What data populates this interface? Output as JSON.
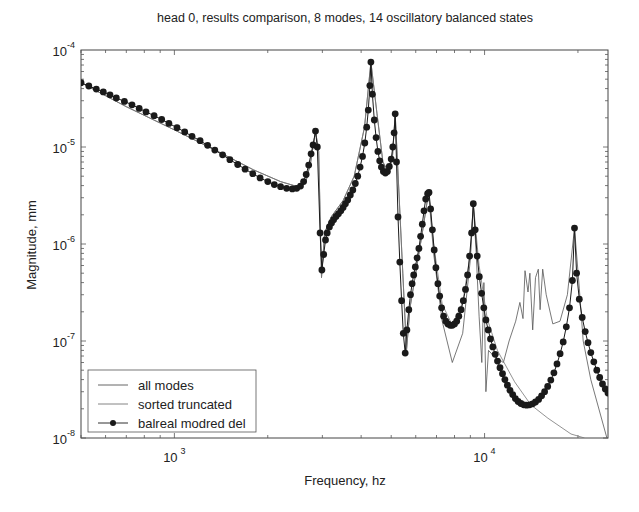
{
  "chart_data": {
    "type": "line",
    "title": "head 0, results comparison, 8 modes, 14 oscillatory balanced states",
    "xlabel": "Frequency, hz",
    "ylabel": "Magnitude, mm",
    "xscale": "log",
    "yscale": "log",
    "xlim": [
      500,
      25000
    ],
    "ylim": [
      1e-08,
      0.0001
    ],
    "xticks": [
      {
        "base": "10",
        "exp": "3",
        "value": 1000
      },
      {
        "base": "10",
        "exp": "4",
        "value": 10000
      }
    ],
    "yticks": [
      {
        "base": "10",
        "exp": "-4",
        "value": 0.0001
      },
      {
        "base": "10",
        "exp": "-5",
        "value": 1e-05
      },
      {
        "base": "10",
        "exp": "-6",
        "value": 1e-06
      },
      {
        "base": "10",
        "exp": "-7",
        "value": 1e-07
      },
      {
        "base": "10",
        "exp": "-8",
        "value": 1e-08
      }
    ],
    "grid": false,
    "legend_position": "bottom-left",
    "series": [
      {
        "name": "all modes",
        "style": "thin-line",
        "color": "#555555",
        "points": [
          [
            500,
            4.6e-05
          ],
          [
            700,
            2.6e-05
          ],
          [
            1000,
            1.5e-05
          ],
          [
            1400,
            8.8e-06
          ],
          [
            1800,
            5.8e-06
          ],
          [
            2200,
            4.4e-06
          ],
          [
            2500,
            3.9e-06
          ],
          [
            2650,
            4.3e-06
          ],
          [
            2750,
            7e-06
          ],
          [
            2850,
            1.46e-05
          ],
          [
            2920,
            9e-06
          ],
          [
            2980,
            4.5e-07
          ],
          [
            3050,
            1.3e-06
          ],
          [
            3200,
            1.9e-06
          ],
          [
            3500,
            2.8e-06
          ],
          [
            3800,
            5e-06
          ],
          [
            4100,
            1.6e-05
          ],
          [
            4300,
            7.5e-05
          ],
          [
            4500,
            2.2e-05
          ],
          [
            4700,
            7e-06
          ],
          [
            4900,
            5.5e-06
          ],
          [
            5050,
            8e-06
          ],
          [
            5150,
            2.2e-05
          ],
          [
            5250,
            6e-06
          ],
          [
            5450,
            5e-07
          ],
          [
            5600,
            8e-08
          ],
          [
            5750,
            2.2e-07
          ],
          [
            6000,
            5e-07
          ],
          [
            6300,
            1.3e-06
          ],
          [
            6600,
            3.4e-06
          ],
          [
            6850,
            8e-07
          ],
          [
            7300,
            1.6e-07
          ],
          [
            7870,
            6e-08
          ],
          [
            8500,
            1.2e-07
          ],
          [
            9000,
            7e-07
          ],
          [
            9200,
            2.6e-06
          ],
          [
            9400,
            8e-07
          ],
          [
            9600,
            1.8e-07
          ],
          [
            9800,
            6e-08
          ],
          [
            9950,
            4e-07
          ],
          [
            10100,
            3e-08
          ],
          [
            10300,
            8e-08
          ],
          [
            10700,
            7e-08
          ],
          [
            11500,
            6e-08
          ],
          [
            12000,
            1e-07
          ],
          [
            12600,
            1.6e-07
          ],
          [
            13000,
            2.5e-07
          ],
          [
            13300,
            1.7e-07
          ],
          [
            13500,
            5.3e-07
          ],
          [
            13800,
            3.2e-07
          ],
          [
            14000,
            5e-07
          ],
          [
            14300,
            1.3e-07
          ],
          [
            14600,
            4.5e-07
          ],
          [
            14900,
            5.5e-07
          ],
          [
            15100,
            2.1e-07
          ],
          [
            15400,
            5.5e-07
          ],
          [
            15800,
            3e-07
          ],
          [
            16600,
            1.5e-07
          ],
          [
            17500,
            1.6e-07
          ],
          [
            18500,
            3e-07
          ],
          [
            19500,
            1.46e-06
          ],
          [
            20200,
            3.5e-07
          ],
          [
            20800,
            1e-07
          ],
          [
            22000,
            4e-08
          ],
          [
            24800,
            1e-08
          ]
        ]
      },
      {
        "name": "sorted truncated",
        "style": "thin-line",
        "color": "#777777",
        "points": [
          [
            500,
            4.6e-05
          ],
          [
            700,
            2.6e-05
          ],
          [
            1000,
            1.5e-05
          ],
          [
            1400,
            8.8e-06
          ],
          [
            1800,
            5.8e-06
          ],
          [
            2200,
            4.4e-06
          ],
          [
            2500,
            3.9e-06
          ],
          [
            2650,
            4.3e-06
          ],
          [
            2750,
            7e-06
          ],
          [
            2850,
            1.46e-05
          ],
          [
            2920,
            9e-06
          ],
          [
            2980,
            4.5e-07
          ],
          [
            3050,
            1.3e-06
          ],
          [
            3200,
            1.9e-06
          ],
          [
            3500,
            2.8e-06
          ],
          [
            3800,
            5e-06
          ],
          [
            4100,
            1.6e-05
          ],
          [
            4300,
            7.5e-05
          ],
          [
            4500,
            2.2e-05
          ],
          [
            4700,
            7e-06
          ],
          [
            4900,
            5.5e-06
          ],
          [
            5050,
            8e-06
          ],
          [
            5150,
            2.2e-05
          ],
          [
            5250,
            6e-06
          ],
          [
            5450,
            5e-07
          ],
          [
            5600,
            8e-08
          ],
          [
            5750,
            2.2e-07
          ],
          [
            6000,
            5e-07
          ],
          [
            6300,
            1.3e-06
          ],
          [
            6600,
            3.4e-06
          ],
          [
            6850,
            1e-06
          ],
          [
            7300,
            2.4e-07
          ],
          [
            7870,
            1.45e-07
          ],
          [
            8500,
            2.5e-07
          ],
          [
            9000,
            8e-07
          ],
          [
            9200,
            2.6e-06
          ],
          [
            9600,
            6e-07
          ],
          [
            10200,
            1.7e-07
          ],
          [
            11000,
            8e-08
          ],
          [
            12500,
            3.8e-08
          ],
          [
            14100,
            2.2e-08
          ],
          [
            16000,
            1.6e-08
          ],
          [
            19000,
            1.1e-08
          ],
          [
            21000,
            1e-08
          ]
        ]
      },
      {
        "name": "balreal modred del",
        "style": "line-with-dots",
        "color": "#1a1a1a",
        "points": [
          [
            500,
            4.6e-05
          ],
          [
            530,
            4.25e-05
          ],
          [
            560,
            3.95e-05
          ],
          [
            590,
            3.7e-05
          ],
          [
            620,
            3.45e-05
          ],
          [
            650,
            3.2e-05
          ],
          [
            690,
            2.95e-05
          ],
          [
            730,
            2.72e-05
          ],
          [
            770,
            2.5e-05
          ],
          [
            810,
            2.3e-05
          ],
          [
            860,
            2.1e-05
          ],
          [
            910,
            1.92e-05
          ],
          [
            960,
            1.75e-05
          ],
          [
            1020,
            1.58e-05
          ],
          [
            1080,
            1.43e-05
          ],
          [
            1140,
            1.29e-05
          ],
          [
            1210,
            1.16e-05
          ],
          [
            1280,
            1.04e-05
          ],
          [
            1350,
            9.3e-06
          ],
          [
            1430,
            8.3e-06
          ],
          [
            1510,
            7.4e-06
          ],
          [
            1600,
            6.6e-06
          ],
          [
            1690,
            5.9e-06
          ],
          [
            1790,
            5.3e-06
          ],
          [
            1890,
            4.8e-06
          ],
          [
            2000,
            4.4e-06
          ],
          [
            2100,
            4.1e-06
          ],
          [
            2200,
            3.9e-06
          ],
          [
            2300,
            3.75e-06
          ],
          [
            2400,
            3.7e-06
          ],
          [
            2480,
            3.75e-06
          ],
          [
            2550,
            3.95e-06
          ],
          [
            2610,
            4.4e-06
          ],
          [
            2660,
            5.2e-06
          ],
          [
            2710,
            6.5e-06
          ],
          [
            2760,
            8.5e-06
          ],
          [
            2800,
            1.05e-05
          ],
          [
            2850,
            1.46e-05
          ],
          [
            2890,
            1e-05
          ],
          [
            2950,
            1.3e-06
          ],
          [
            2990,
            5.4e-07
          ],
          [
            3030,
            7.8e-07
          ],
          [
            3070,
            1.1e-06
          ],
          [
            3110,
            1.3e-06
          ],
          [
            3160,
            1.5e-06
          ],
          [
            3210,
            1.65e-06
          ],
          [
            3260,
            1.78e-06
          ],
          [
            3320,
            1.92e-06
          ],
          [
            3380,
            2.05e-06
          ],
          [
            3440,
            2.2e-06
          ],
          [
            3500,
            2.38e-06
          ],
          [
            3560,
            2.6e-06
          ],
          [
            3620,
            2.85e-06
          ],
          [
            3690,
            3.2e-06
          ],
          [
            3760,
            3.6e-06
          ],
          [
            3830,
            4.2e-06
          ],
          [
            3900,
            5e-06
          ],
          [
            3970,
            6.2e-06
          ],
          [
            4040,
            8e-06
          ],
          [
            4110,
            1.1e-05
          ],
          [
            4170,
            1.6e-05
          ],
          [
            4220,
            2.4e-05
          ],
          [
            4270,
            4.3e-05
          ],
          [
            4300,
            7.5e-05
          ],
          [
            4350,
            3.5e-05
          ],
          [
            4410,
            1.9e-05
          ],
          [
            4470,
            1.25e-05
          ],
          [
            4530,
            9e-06
          ],
          [
            4590,
            7.2e-06
          ],
          [
            4650,
            6.2e-06
          ],
          [
            4720,
            5.6e-06
          ],
          [
            4790,
            5.4e-06
          ],
          [
            4860,
            5.6e-06
          ],
          [
            4930,
            6.3e-06
          ],
          [
            5000,
            7.5e-06
          ],
          [
            5060,
            1e-05
          ],
          [
            5110,
            1.4e-05
          ],
          [
            5150,
            2.2e-05
          ],
          [
            5200,
            7e-06
          ],
          [
            5260,
            1.9e-06
          ],
          [
            5330,
            6.5e-07
          ],
          [
            5400,
            2.6e-07
          ],
          [
            5470,
            1.2e-07
          ],
          [
            5550,
            7.5e-08
          ],
          [
            5620,
            1.3e-07
          ],
          [
            5700,
            2.1e-07
          ],
          [
            5770,
            3e-07
          ],
          [
            5840,
            3.9e-07
          ],
          [
            5910,
            4.8e-07
          ],
          [
            5980,
            5.8e-07
          ],
          [
            6060,
            7.2e-07
          ],
          [
            6140,
            9e-07
          ],
          [
            6220,
            1.2e-06
          ],
          [
            6300,
            1.6e-06
          ],
          [
            6380,
            2.2e-06
          ],
          [
            6460,
            2.9e-06
          ],
          [
            6550,
            3.3e-06
          ],
          [
            6620,
            3.4e-06
          ],
          [
            6700,
            2.3e-06
          ],
          [
            6790,
            1.4e-06
          ],
          [
            6880,
            8.7e-07
          ],
          [
            6970,
            5.7e-07
          ],
          [
            7070,
            3.9e-07
          ],
          [
            7170,
            2.9e-07
          ],
          [
            7270,
            2.2e-07
          ],
          [
            7380,
            1.8e-07
          ],
          [
            7500,
            1.6e-07
          ],
          [
            7620,
            1.5e-07
          ],
          [
            7750,
            1.45e-07
          ],
          [
            7870,
            1.45e-07
          ],
          [
            8000,
            1.5e-07
          ],
          [
            8130,
            1.6e-07
          ],
          [
            8260,
            1.8e-07
          ],
          [
            8400,
            2.1e-07
          ],
          [
            8540,
            2.6e-07
          ],
          [
            8680,
            3.4e-07
          ],
          [
            8820,
            4.8e-07
          ],
          [
            8950,
            7.5e-07
          ],
          [
            9080,
            1.3e-06
          ],
          [
            9200,
            2.6e-06
          ],
          [
            9330,
            1.4e-06
          ],
          [
            9470,
            7.5e-07
          ],
          [
            9620,
            4.6e-07
          ],
          [
            9780,
            3.1e-07
          ],
          [
            9940,
            2.2e-07
          ],
          [
            10100,
            1.65e-07
          ],
          [
            10270,
            1.3e-07
          ],
          [
            10450,
            1.05e-07
          ],
          [
            10630,
            8.7e-08
          ],
          [
            10820,
            7.3e-08
          ],
          [
            11010,
            6.2e-08
          ],
          [
            11210,
            5.3e-08
          ],
          [
            11420,
            4.6e-08
          ],
          [
            11630,
            4e-08
          ],
          [
            11850,
            3.5e-08
          ],
          [
            12080,
            3.1e-08
          ],
          [
            12320,
            2.8e-08
          ],
          [
            12570,
            2.55e-08
          ],
          [
            12830,
            2.38e-08
          ],
          [
            13100,
            2.27e-08
          ],
          [
            13380,
            2.2e-08
          ],
          [
            13670,
            2.18e-08
          ],
          [
            13970,
            2.2e-08
          ],
          [
            14280,
            2.25e-08
          ],
          [
            14600,
            2.35e-08
          ],
          [
            14930,
            2.5e-08
          ],
          [
            15270,
            2.72e-08
          ],
          [
            15620,
            3e-08
          ],
          [
            15980,
            3.4e-08
          ],
          [
            16350,
            3.95e-08
          ],
          [
            16730,
            4.7e-08
          ],
          [
            17120,
            5.8e-08
          ],
          [
            17520,
            7.4e-08
          ],
          [
            17930,
            9.8e-08
          ],
          [
            18350,
            1.4e-07
          ],
          [
            18780,
            2.2e-07
          ],
          [
            19200,
            4.2e-07
          ],
          [
            19500,
            1.46e-06
          ],
          [
            19800,
            5e-07
          ],
          [
            20200,
            2.7e-07
          ],
          [
            20650,
            1.75e-07
          ],
          [
            21100,
            1.25e-07
          ],
          [
            21550,
            9.6e-08
          ],
          [
            22000,
            7.6e-08
          ],
          [
            22500,
            6.1e-08
          ],
          [
            23000,
            5e-08
          ],
          [
            23500,
            4.2e-08
          ],
          [
            24000,
            3.6e-08
          ],
          [
            24500,
            3.2e-08
          ],
          [
            25000,
            2.9e-08
          ]
        ]
      }
    ]
  }
}
